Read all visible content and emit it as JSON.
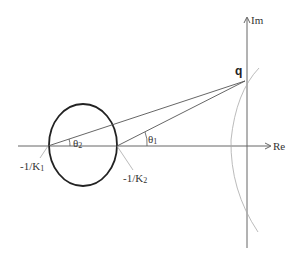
{
  "diagram": {
    "axes": {
      "real_label": "Re",
      "imag_label": "Im"
    },
    "points": {
      "q_label": "q",
      "k1_label_prefix": "-1/K",
      "k1_label_sub": "1",
      "k2_label_prefix": "-1/K",
      "k2_label_sub": "2"
    },
    "angles": {
      "theta1_symbol": "θ",
      "theta1_sub": "1",
      "theta2_symbol": "θ",
      "theta2_sub": "2"
    },
    "colors": {
      "axis": "#666666",
      "circle": "#222222",
      "lines": "#555555",
      "curve": "#aaaaaa"
    }
  }
}
